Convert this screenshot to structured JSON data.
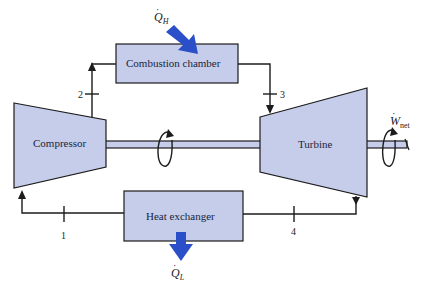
{
  "diagram": {
    "components": {
      "combustion_chamber": "Combustion chamber",
      "compressor": "Compressor",
      "turbine": "Turbine",
      "heat_exchanger": "Heat exchanger"
    },
    "states": [
      "1",
      "2",
      "3",
      "4"
    ],
    "energy_labels": {
      "heat_in": {
        "symbol": "Q",
        "sub": "H"
      },
      "heat_out": {
        "symbol": "Q",
        "sub": "L"
      },
      "work_net": {
        "symbol": "W",
        "sub": "net"
      }
    },
    "colors": {
      "component_fill": "#c5cdea",
      "line": "#1c1c1c",
      "heat_arrow": "#2b4fc9"
    }
  }
}
